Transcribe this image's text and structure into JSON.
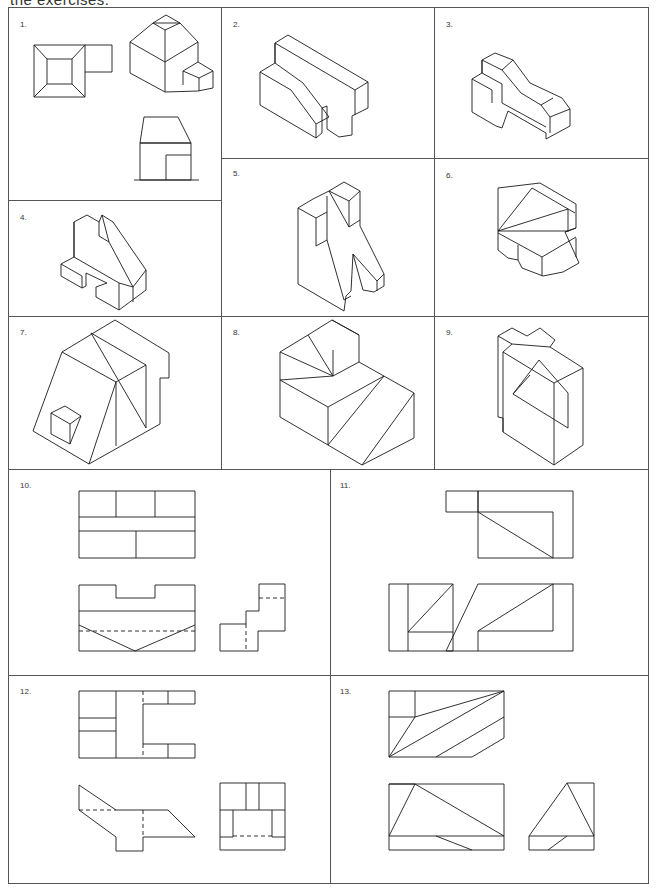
{
  "page": {
    "header_text": "the exercises.",
    "panels": [
      {
        "number": "1.",
        "type": "isometric+orthographic",
        "description": "Plan view, isometric and front elevation of building with annex"
      },
      {
        "number": "2.",
        "type": "isometric",
        "description": "Block with sloped step and notch"
      },
      {
        "number": "3.",
        "type": "isometric",
        "description": "Stepped block with angled top"
      },
      {
        "number": "4.",
        "type": "isometric",
        "description": "Block with V-slot and base notch"
      },
      {
        "number": "5.",
        "type": "isometric",
        "description": "Upright block with cut-out"
      },
      {
        "number": "6.",
        "type": "isometric",
        "description": "Wedge block with slotted base"
      },
      {
        "number": "7.",
        "type": "isometric",
        "description": "Sloped block with small box"
      },
      {
        "number": "8.",
        "type": "isometric",
        "description": "Stepped block with triangulated faces"
      },
      {
        "number": "9.",
        "type": "isometric",
        "description": "Block with cross top and angled recess"
      },
      {
        "number": "10.",
        "type": "orthographic",
        "description": "Three-view drawing with hidden lines"
      },
      {
        "number": "11.",
        "type": "orthographic",
        "description": "Three-view drawing with diagonals"
      },
      {
        "number": "12.",
        "type": "orthographic",
        "description": "Three-view drawing of U-shaped part"
      },
      {
        "number": "13.",
        "type": "orthographic",
        "description": "Three-view drawing with triangulated faces"
      }
    ]
  }
}
